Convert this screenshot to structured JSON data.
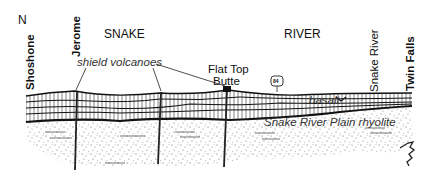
{
  "figure": {
    "type": "geologic cross-section",
    "orientation_label": "N",
    "region_labels": [
      "SNAKE",
      "RIVER"
    ],
    "towns": [
      {
        "name": "Shoshone",
        "x": 24
      },
      {
        "name": "Jerome",
        "x": 229
      },
      {
        "name": "Twin Falls",
        "x": 411
      }
    ],
    "features": {
      "river": "Snake River",
      "highway_shield": "84",
      "volcanoes_label": "shield volcanoes",
      "butte_label_line1": "Flat Top",
      "butte_label_line2": "Butte"
    },
    "units": [
      {
        "name": "basalt",
        "description": "layered basalt flows (upper unit)"
      },
      {
        "name": "Snake River Plain rhyolite",
        "description": "stippled lower unit"
      }
    ],
    "colors": {
      "ink": "#111111",
      "background": "#ffffff",
      "stipple": "#444444"
    }
  }
}
